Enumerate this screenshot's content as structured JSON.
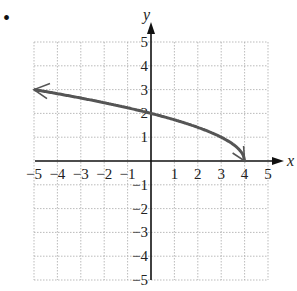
{
  "bullet": "•",
  "chart_data": {
    "type": "line",
    "title": "",
    "xlabel": "x",
    "ylabel": "y",
    "xlim": [
      -5,
      5
    ],
    "ylim": [
      -5,
      5
    ],
    "grid": true,
    "x_ticks": [
      "−5",
      "−4",
      "−3",
      "−2",
      "−1",
      "1",
      "2",
      "3",
      "4",
      "5"
    ],
    "y_ticks": [
      "5",
      "4",
      "3",
      "2",
      "1",
      "−1",
      "−2",
      "−3",
      "−4",
      "−5"
    ],
    "series": [
      {
        "name": "f(x) = sqrt(4 - x)",
        "x": [
          -5,
          -4,
          -3,
          -2,
          -1,
          0,
          1,
          2,
          3,
          3.75,
          4
        ],
        "y": [
          3,
          2.83,
          2.65,
          2.45,
          2.24,
          2,
          1.73,
          1.41,
          1,
          0.5,
          0
        ],
        "left_end": "arrow",
        "right_end": "arrow-point-at (4,0)",
        "color": "#555555"
      }
    ]
  }
}
